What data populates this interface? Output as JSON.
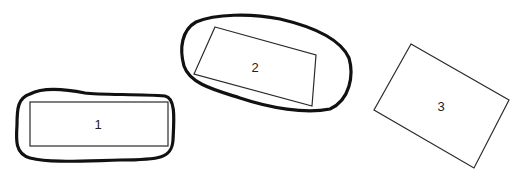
{
  "diagram": {
    "shapes": [
      {
        "id": "1",
        "label": "1",
        "outlined": true
      },
      {
        "id": "2",
        "label": "2",
        "outlined": true
      },
      {
        "id": "3",
        "label": "3",
        "outlined": false
      }
    ]
  }
}
